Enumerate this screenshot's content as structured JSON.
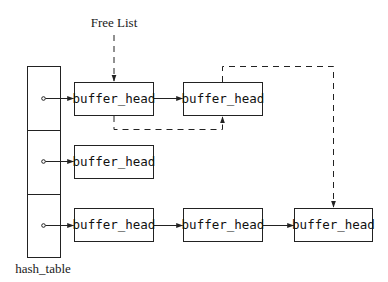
{
  "diagram": {
    "free_list_label": "Free List",
    "hash_table_label": "hash_table",
    "node_label": "buffer_head",
    "rows": [
      {
        "index": 0,
        "nodes": [
          "buffer_head",
          "buffer_head"
        ]
      },
      {
        "index": 1,
        "nodes": [
          "buffer_head"
        ]
      },
      {
        "index": 2,
        "nodes": [
          "buffer_head",
          "buffer_head",
          "buffer_head"
        ]
      }
    ],
    "edges": [
      {
        "from": "hash_table[0]",
        "to": "row0.node0",
        "style": "solid"
      },
      {
        "from": "row0.node0",
        "to": "row0.node1",
        "style": "solid"
      },
      {
        "from": "hash_table[1]",
        "to": "row1.node0",
        "style": "solid"
      },
      {
        "from": "hash_table[2]",
        "to": "row2.node0",
        "style": "solid"
      },
      {
        "from": "row2.node0",
        "to": "row2.node1",
        "style": "solid"
      },
      {
        "from": "row2.node1",
        "to": "row2.node2",
        "style": "solid"
      },
      {
        "from": "Free List",
        "to": "row0.node0",
        "style": "dashed"
      },
      {
        "from": "row0.node0",
        "to": "row0.node1",
        "style": "dashed"
      },
      {
        "from": "row0.node1",
        "to": "row2.node2",
        "style": "dashed"
      }
    ]
  }
}
